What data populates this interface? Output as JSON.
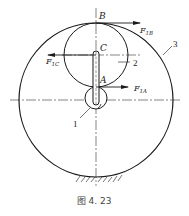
{
  "figure": {
    "caption": "图 4. 23",
    "points": {
      "B": "B",
      "C": "C",
      "A": "A"
    },
    "forces": {
      "F1B": {
        "main": "F",
        "sub": "1B"
      },
      "F1C": {
        "main": "F",
        "sub": "1C"
      },
      "F1A": {
        "main": "F",
        "sub": "1A"
      }
    },
    "part_numbers": {
      "part1": "1",
      "part2": "2",
      "part3": "3"
    },
    "colors": {
      "line": "#1a1a1a",
      "background": "#ffffff"
    }
  }
}
